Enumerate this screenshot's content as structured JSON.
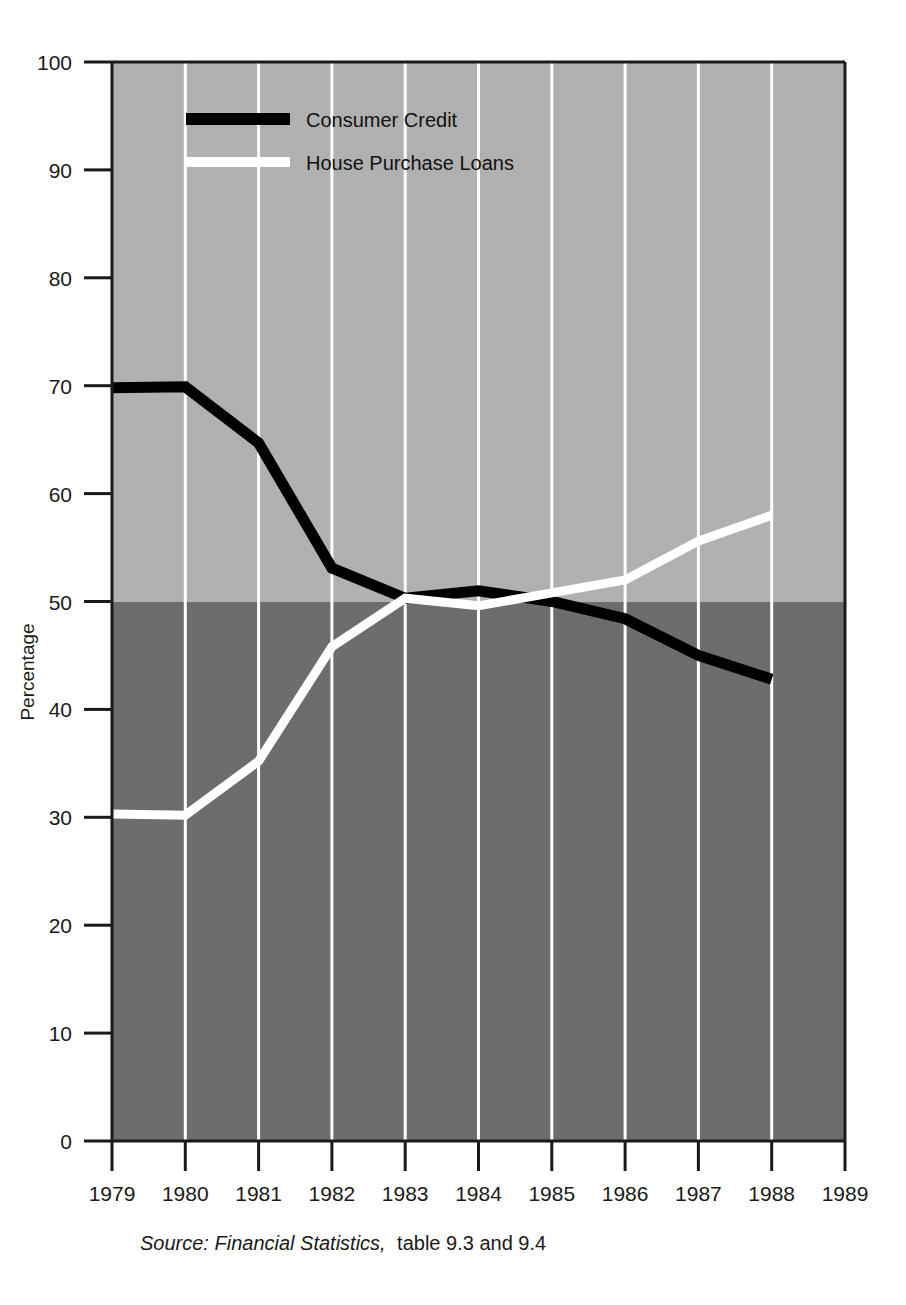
{
  "figure": {
    "y_axis_title": "Percentage",
    "source_note_italic": "Source: Financial Statistics,",
    "source_note_plain": "table 9.3 and 9.4",
    "colors": {
      "band_upper": "#b4b4b4",
      "band_lower": "#6e6e6e",
      "gridline": "#ffffff",
      "axis": "#1a1a1a",
      "consumer_credit": "#000000",
      "house_purchase_loans": "#ffffff",
      "page_background": "#ffffff"
    }
  },
  "legend": {
    "position": "top-left-inside",
    "entries": [
      {
        "label": "Consumer Credit",
        "color": "#000000",
        "swatch": "line-swatch-black"
      },
      {
        "label": "House Purchase Loans",
        "color": "#ffffff",
        "swatch": "line-swatch-white"
      }
    ]
  },
  "chart_data": {
    "type": "line",
    "title": "",
    "subtitle": "",
    "xlabel": "",
    "ylabel": "Percentage",
    "xlim": [
      1979,
      1989
    ],
    "ylim": [
      0,
      100
    ],
    "grid": true,
    "grid_axis": "x",
    "legend_position": "top-left-inside",
    "x_tick_labels": [
      "1979",
      "1980",
      "1981",
      "1982",
      "1983",
      "1984",
      "1985",
      "1986",
      "1987",
      "1988",
      "1989"
    ],
    "y_tick_labels": [
      "0",
      "10",
      "20",
      "30",
      "40",
      "50",
      "60",
      "70",
      "80",
      "90",
      "100"
    ],
    "x": [
      1979,
      1980,
      1981,
      1982,
      1983,
      1984,
      1985,
      1986,
      1987,
      1988
    ],
    "series": [
      {
        "name": "Consumer Credit",
        "color": "#000000",
        "values": [
          69.8,
          69.9,
          64.7,
          53.1,
          50.3,
          51.0,
          50.0,
          48.4,
          45.0,
          42.8
        ]
      },
      {
        "name": "House Purchase Loans",
        "color": "#ffffff",
        "values": [
          30.3,
          30.2,
          35.2,
          45.8,
          50.3,
          49.6,
          50.8,
          52.0,
          55.6,
          58.0
        ]
      }
    ],
    "shaded_bands": [
      {
        "name": "upper-band",
        "from": 50,
        "to": 100,
        "color": "#b4b4b4"
      },
      {
        "name": "lower-band",
        "from": 0,
        "to": 50,
        "color": "#6e6e6e"
      }
    ]
  }
}
